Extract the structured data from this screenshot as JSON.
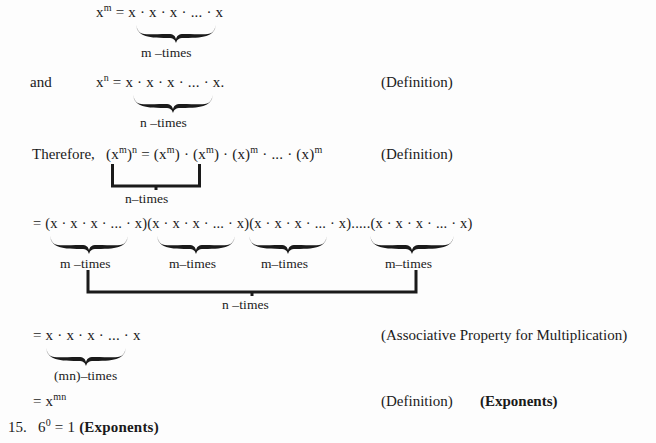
{
  "document": {
    "type": "math-proof",
    "topic": "Power of a power rule derivation",
    "background": "#fdfdfd",
    "ink": "#1a1a1a"
  },
  "lines": {
    "eq1": "x^m = x · x · x · ... · x",
    "eq1_base": "x",
    "eq1_exp": "m",
    "eq1_rest": " = x · x · x · ... · x",
    "and_word": "and",
    "eq2_base": "x",
    "eq2_exp": "n",
    "eq2_rest": " = x · x · x · ... · x.",
    "therefore_word": "Therefore,",
    "eq3": "(xᵐ)ⁿ = (xᵐ) · (xᵐ) · (x)ᵐ · ... · (x)ᵐ",
    "eq4": "= (x · x · x · ... · x)(x · x · x · ... · x)(x · x · x · ... · x).....(x · x · x · ... · x)",
    "eq5": "= x · x · x · ... · x",
    "eq6_prefix": "= x",
    "eq6_exp": "mn",
    "item_number": "15.",
    "item_base": "6",
    "item_exp": "0",
    "item_rest": " = 1 ",
    "item_tag": "(Exponents)"
  },
  "brace_labels": {
    "m_times": "m –times",
    "n_times": "n –times",
    "n_times_tight": "n–times",
    "n_times_wide": "n    –times",
    "m_times_1": "m –times",
    "m_times_2": "m–times",
    "m_times_3": "m–times",
    "m_times_4": "m–times",
    "mn_times": "(mn)–times"
  },
  "annotations": {
    "definition_1": "(Definition)",
    "definition_2": "(Definition)",
    "associative": "(Associative Property for Multiplication)",
    "definition_3": "(Definition)",
    "exponents_tag": "(Exponents)"
  }
}
